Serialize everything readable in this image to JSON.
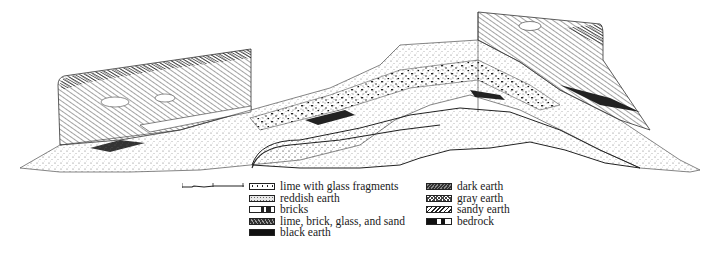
{
  "figure": {
    "type": "stratigraphic cross-section drawing",
    "scale_bar": {
      "ticks": 3
    }
  },
  "legend": {
    "left_column": [
      {
        "label": "lime with glass fragments",
        "pattern": "dotted-white"
      },
      {
        "label": "reddish earth",
        "pattern": "fine-stipple"
      },
      {
        "label": "bricks",
        "pattern": "white-with-black-blocks"
      },
      {
        "label": "lime, brick, glass, and sand",
        "pattern": "mixed-dark"
      },
      {
        "label": "black earth",
        "pattern": "solid-black"
      }
    ],
    "right_column": [
      {
        "label": "dark earth",
        "pattern": "dense-diagonal-hatch"
      },
      {
        "label": "gray earth",
        "pattern": "cross-hatch"
      },
      {
        "label": "sandy earth",
        "pattern": "zigzag"
      },
      {
        "label": "bedrock",
        "pattern": "black-white-split"
      }
    ]
  }
}
